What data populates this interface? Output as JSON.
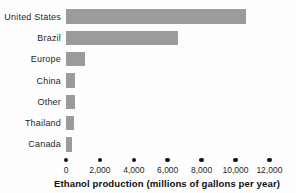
{
  "chart_data": {
    "type": "bar",
    "orientation": "horizontal",
    "title": "",
    "xlabel": "Ethanol production (millions of gallons per year)",
    "ylabel": "",
    "categories": [
      "United States",
      "Brazil",
      "Europe",
      "China",
      "Other",
      "Thailand",
      "Canada"
    ],
    "values": [
      10600,
      6600,
      1100,
      550,
      500,
      450,
      350
    ],
    "xlim": [
      0,
      12000
    ],
    "xticks": [
      0,
      2000,
      4000,
      6000,
      8000,
      10000,
      12000
    ],
    "xtick_labels": [
      "0",
      "2,000",
      "4,000",
      "6,000",
      "8,000",
      "10,000",
      "12,000"
    ],
    "grid": false,
    "legend": "none",
    "bar_color": "#9b9b9b",
    "tick_marker": "dot",
    "tick_marker_color": "#141414",
    "background_color": "#fefefe"
  }
}
